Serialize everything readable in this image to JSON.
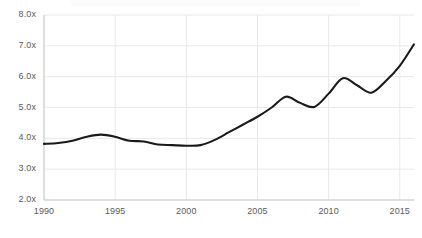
{
  "chart_data": {
    "type": "line",
    "title": "",
    "xlabel": "",
    "ylabel": "",
    "xlim": [
      1990,
      2016
    ],
    "ylim": [
      2.0,
      8.0
    ],
    "grid": true,
    "legend": null,
    "line_color": "#1a1a1a",
    "grid_color": "#e8e8e8",
    "axis_color": "#c9c9c9",
    "tick_label_color": "#595959",
    "ytick_labels": [
      "8.0x",
      "7.0x",
      "6.0x",
      "5.0x",
      "4.0x",
      "3.0x",
      "2.0x"
    ],
    "ytick_values": [
      8.0,
      7.0,
      6.0,
      5.0,
      4.0,
      3.0,
      2.0
    ],
    "xtick_labels": [
      "1990",
      "1995",
      "2000",
      "2005",
      "2010",
      "2015"
    ],
    "xtick_values": [
      1990,
      1995,
      2000,
      2005,
      2010,
      2015
    ],
    "x": [
      1990,
      1991,
      1992,
      1993,
      1994,
      1995,
      1996,
      1997,
      1998,
      1999,
      2000,
      2001,
      2002,
      2003,
      2004,
      2005,
      2006,
      2007,
      2008,
      2009,
      2010,
      2011,
      2012,
      2013,
      2014,
      2015,
      2016
    ],
    "values": [
      3.82,
      3.85,
      3.92,
      4.05,
      4.12,
      4.05,
      3.92,
      3.9,
      3.8,
      3.78,
      3.76,
      3.78,
      3.95,
      4.2,
      4.45,
      4.7,
      5.0,
      5.35,
      5.15,
      5.02,
      5.45,
      5.95,
      5.72,
      5.48,
      5.85,
      6.35,
      7.05
    ]
  }
}
